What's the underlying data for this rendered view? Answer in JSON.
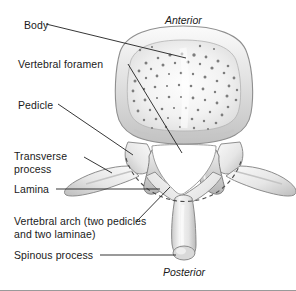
{
  "figure": {
    "background_color": "#ffffff",
    "border_color": "#9a9a9a",
    "width": 296,
    "height": 291
  },
  "orientation": {
    "top_label": "Anterior",
    "bottom_label": "Posterior"
  },
  "labels": [
    {
      "id": "body",
      "text": "Body"
    },
    {
      "id": "vertebral-foramen",
      "text": "Vertebral foramen"
    },
    {
      "id": "pedicle",
      "text": "Pedicle"
    },
    {
      "id": "transverse-process",
      "text": "Transverse\nprocess"
    },
    {
      "id": "lamina",
      "text": "Lamina"
    },
    {
      "id": "vertebral-arch",
      "text": "Vertebral arch (two pedicles\nand two laminae)"
    },
    {
      "id": "spinous-process",
      "text": "Spinous process"
    }
  ],
  "structures": [
    {
      "id": "vertebral-body",
      "name": "Vertebral body"
    },
    {
      "id": "vertebral-foramen-opening",
      "name": "Vertebral foramen"
    },
    {
      "id": "pedicle-left",
      "name": "Left pedicle"
    },
    {
      "id": "pedicle-right",
      "name": "Right pedicle"
    },
    {
      "id": "transverse-process-left",
      "name": "Left transverse process"
    },
    {
      "id": "transverse-process-right",
      "name": "Right transverse process"
    },
    {
      "id": "lamina-left",
      "name": "Left lamina"
    },
    {
      "id": "lamina-right",
      "name": "Right lamina"
    },
    {
      "id": "spinous-process-bone",
      "name": "Spinous process"
    },
    {
      "id": "superior-articular-process-left",
      "name": "Left superior articular process"
    },
    {
      "id": "superior-articular-process-right",
      "name": "Right superior articular process"
    },
    {
      "id": "vertebral-arch-dashed-outline",
      "name": "Vertebral arch dashed outline"
    }
  ],
  "colors": {
    "ink": "#1a1a1a",
    "leader_line": "#2b2b2b",
    "bone_light": "#f7f7f7",
    "bone_mid": "#d8d8d8",
    "bone_shadow": "#a8a8a8",
    "bone_outline": "#8a8a8a",
    "trabecula": "#7d7d7d",
    "dashed_arch": "#4a4a4a"
  }
}
